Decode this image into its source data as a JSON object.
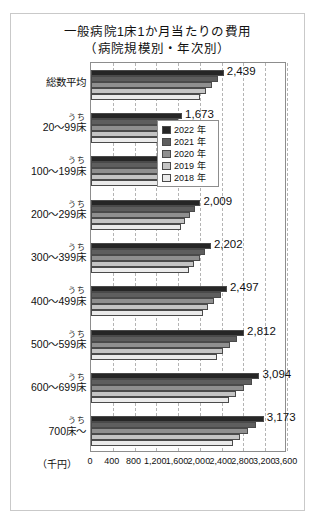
{
  "chart_data": {
    "type": "bar",
    "orientation": "horizontal",
    "title": "一般病院1床1か月当たりの費用",
    "subtitle": "（病院規模別・年次別）",
    "xlabel": "（千円）",
    "ylabel": "",
    "xlim": [
      0,
      3600
    ],
    "xticks": [
      0,
      400,
      800,
      1200,
      1600,
      2000,
      2400,
      2800,
      3200,
      3600
    ],
    "xtick_labels": [
      "0",
      "400",
      "800",
      "1,200",
      "1,600",
      "2,000",
      "2,400",
      "2,800",
      "3,200",
      "3,600"
    ],
    "grid": true,
    "legend_position": "upper-right-inside",
    "categories": [
      "総数平均",
      "20〜99床",
      "100〜199床",
      "200〜299床",
      "300〜399床",
      "400〜499床",
      "500〜599床",
      "600〜699床",
      "700床〜"
    ],
    "category_prefixes": [
      "",
      "うち",
      "うち",
      "うち",
      "うち",
      "うち",
      "うち",
      "うち",
      "うち"
    ],
    "series": [
      {
        "name": "2022 年",
        "color": "#262626",
        "values": [
          2439,
          1673,
          1571,
          2009,
          2202,
          2497,
          2812,
          3094,
          3173
        ]
      },
      {
        "name": "2021 年",
        "color": "#5e5e5e",
        "values": [
          2330,
          1598,
          1500,
          1918,
          2103,
          2385,
          2686,
          2955,
          3030
        ]
      },
      {
        "name": "2020 年",
        "color": "#8f8f8f",
        "values": [
          2215,
          1520,
          1428,
          1824,
          2000,
          2268,
          2555,
          2810,
          2881
        ]
      },
      {
        "name": "2019 年",
        "color": "#c4c4c4",
        "values": [
          2105,
          1445,
          1357,
          1734,
          1901,
          2156,
          2428,
          2671,
          2739
        ]
      },
      {
        "name": "2018 年",
        "color": "#eaeaea",
        "values": [
          2000,
          1373,
          1290,
          1648,
          1806,
          2048,
          2307,
          2538,
          2602
        ]
      }
    ],
    "data_labels": [
      "2,439",
      "1,673",
      "1,571",
      "2,009",
      "2,202",
      "2,497",
      "2,812",
      "3,094",
      "3,173"
    ],
    "data_label_series": "2022 年"
  }
}
